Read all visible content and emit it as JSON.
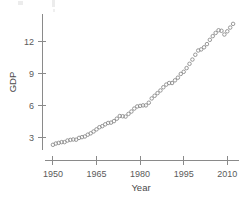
{
  "chart_data": {
    "type": "scatter",
    "title": "",
    "subtitle": "",
    "xlabel": "Year",
    "ylabel": "GDP",
    "xlim": [
      1949,
      2013
    ],
    "ylim": [
      2.0,
      14.2
    ],
    "xticks": [
      1950,
      1965,
      1980,
      1995,
      2010
    ],
    "xticklabels": [
      "1950",
      "1965",
      "1980",
      "1995",
      "2010"
    ],
    "yticks": [
      3,
      6,
      9,
      12
    ],
    "yticklabels": [
      "3",
      "6",
      "9",
      "12"
    ],
    "grid": false,
    "legend": null,
    "marker": "open-circle",
    "marker_color": "#8c8c8c",
    "series": [
      {
        "name": "GDP",
        "x": [
          1950,
          1951,
          1952,
          1953,
          1954,
          1955,
          1956,
          1957,
          1958,
          1959,
          1960,
          1961,
          1962,
          1963,
          1964,
          1965,
          1966,
          1967,
          1968,
          1969,
          1970,
          1971,
          1972,
          1973,
          1974,
          1975,
          1976,
          1977,
          1978,
          1979,
          1980,
          1981,
          1982,
          1983,
          1984,
          1985,
          1986,
          1987,
          1988,
          1989,
          1990,
          1991,
          1992,
          1993,
          1994,
          1995,
          1996,
          1997,
          1998,
          1999,
          2000,
          2001,
          2002,
          2003,
          2004,
          2005,
          2006,
          2007,
          2008,
          2009,
          2010,
          2011,
          2012
        ],
        "y": [
          2.3,
          2.42,
          2.48,
          2.55,
          2.55,
          2.7,
          2.76,
          2.8,
          2.78,
          2.95,
          3.02,
          3.08,
          3.25,
          3.38,
          3.55,
          3.75,
          3.95,
          4.05,
          4.22,
          4.35,
          4.38,
          4.52,
          4.75,
          5.0,
          4.98,
          4.95,
          5.2,
          5.42,
          5.7,
          5.9,
          5.95,
          6.0,
          6.0,
          6.25,
          6.65,
          6.9,
          7.15,
          7.4,
          7.7,
          7.95,
          8.1,
          8.1,
          8.35,
          8.6,
          8.95,
          9.15,
          9.5,
          9.9,
          10.3,
          10.75,
          11.15,
          11.25,
          11.45,
          11.75,
          12.15,
          12.5,
          12.8,
          13.05,
          13.0,
          12.65,
          12.95,
          13.3,
          13.65
        ]
      }
    ]
  }
}
